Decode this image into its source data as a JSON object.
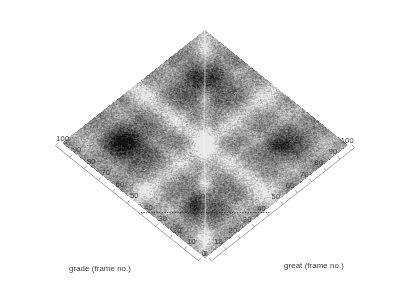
{
  "figure": {
    "type": "surface-3d-topdown",
    "background": "#ffffff",
    "width": 402,
    "height": 301
  },
  "axes": {
    "left": {
      "title": "grade (frame no.)",
      "ticks": [
        "0",
        "10",
        "20",
        "30",
        "40",
        "50",
        "60",
        "70",
        "80",
        "90",
        "100"
      ],
      "range": [
        0,
        100
      ],
      "step": 10
    },
    "right": {
      "title": "great (frame no.)",
      "ticks": [
        "0",
        "10",
        "20",
        "30",
        "40",
        "50",
        "60",
        "70",
        "80",
        "90",
        "100"
      ],
      "range": [
        0,
        100
      ],
      "step": 10
    }
  },
  "chart_data": {
    "type": "heatmap",
    "title": "",
    "xlabel": "great (frame no.)",
    "ylabel": "grade (frame no.)",
    "xlim": [
      0,
      100
    ],
    "ylim": [
      0,
      100
    ],
    "grid": false,
    "legend": "none",
    "colormap": "gray",
    "projection": "isometric-diamond",
    "x_ticks": [
      0,
      10,
      20,
      30,
      40,
      50,
      60,
      70,
      80,
      90,
      100
    ],
    "y_ticks": [
      0,
      10,
      20,
      30,
      40,
      50,
      60,
      70,
      80,
      90,
      100
    ],
    "features": [
      {
        "name": "bright-central-cross",
        "value": "high",
        "x": 50,
        "y": 50
      },
      {
        "name": "dark-lobe-upper-left",
        "value": "low",
        "x": 25,
        "y": 78
      },
      {
        "name": "dark-lobe-upper-right",
        "value": "low",
        "x": 78,
        "y": 78
      },
      {
        "name": "dark-lobe-lower-left",
        "value": "low",
        "x": 25,
        "y": 28
      },
      {
        "name": "dark-lobe-lower-right",
        "value": "low",
        "x": 72,
        "y": 25
      },
      {
        "name": "dotted-reference-line",
        "value": "marker",
        "y": 42
      }
    ],
    "z_range": [
      0.0,
      1.0
    ],
    "values_note": "intensity 0 = dark (low similarity), 1 = light (high similarity)"
  }
}
